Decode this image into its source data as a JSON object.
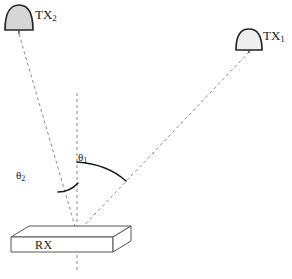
{
  "figure": {
    "type": "schematic-diagram",
    "width": 292,
    "height": 279,
    "background_color": "#ffffff"
  },
  "labels": {
    "tx1": {
      "text": "TX",
      "sub": "1"
    },
    "tx2": {
      "text": "TX",
      "sub": "2"
    },
    "theta1": {
      "text": "θ",
      "sub": "1"
    },
    "theta2": {
      "text": "θ",
      "sub": "2"
    },
    "rx": {
      "text": "RX"
    }
  },
  "colors": {
    "outline": "#262626",
    "antenna_fill": "#d6d6d6",
    "dashed_line": "#8a8a8a",
    "box_stroke": "#555555",
    "box_fill": "#ffffff",
    "text": "#1a1a1a"
  },
  "geometry": {
    "receiver_point": {
      "x": 77,
      "y": 233
    },
    "tx1_feed": {
      "x": 249,
      "y": 52
    },
    "tx2_feed": {
      "x": 19,
      "y": 34
    },
    "normal_line": {
      "x": 77,
      "y_top": 93,
      "y_bottom": 272
    },
    "tx1_dome": {
      "cx": 249,
      "cy": 50,
      "rx": 13,
      "ry": 21
    },
    "tx2_dome": {
      "cx": 19,
      "cy": 29,
      "rx": 14,
      "ry": 24
    },
    "rx_box": {
      "front_top_left": {
        "x": 11,
        "y": 237
      },
      "front_bottom_right": {
        "x": 113,
        "y": 252
      },
      "depth_dx": 18,
      "depth_dy": -11
    },
    "arc_theta1": {
      "from": {
        "x": 77,
        "y": 162
      },
      "to": {
        "x": 126,
        "y": 181
      }
    },
    "arc_theta2": {
      "from": {
        "x": 58,
        "y": 192
      },
      "to": {
        "x": 78,
        "y": 183
      }
    }
  },
  "elements": {
    "tx1_name": "transmitter-1-antenna",
    "tx2_name": "transmitter-2-antenna",
    "rx_name": "receiver-box",
    "ray1_name": "ray-tx1-to-rx",
    "ray2_name": "ray-tx2-to-rx",
    "normal_name": "surface-normal-line"
  }
}
